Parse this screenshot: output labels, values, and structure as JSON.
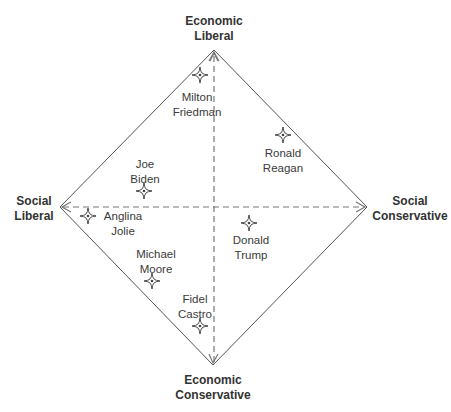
{
  "diagram": {
    "type": "political-compass-diamond",
    "axes": {
      "top": {
        "line1": "Economic",
        "line2": "Liberal"
      },
      "bottom": {
        "line1": "Economic",
        "line2": "Conservative"
      },
      "left": {
        "line1": "Social",
        "line2": "Liberal"
      },
      "right": {
        "line1": "Social",
        "line2": "Conservative"
      }
    },
    "colors": {
      "line": "#555555",
      "dashed_axis": "#777777",
      "marker": "#444444",
      "text": "#333333"
    },
    "people": [
      {
        "line1": "Milton",
        "line2": "Friedman",
        "marker_x": 200,
        "marker_y": 75
      },
      {
        "line1": "Ronald",
        "line2": "Reagan",
        "marker_x": 283,
        "marker_y": 135
      },
      {
        "line1": "Joe",
        "line2": "Biden",
        "marker_x": 144,
        "marker_y": 191
      },
      {
        "line1": "Anglina",
        "line2": "Jolie",
        "marker_x": 88,
        "marker_y": 216
      },
      {
        "line1": "Donald",
        "line2": "Trump",
        "marker_x": 249,
        "marker_y": 223
      },
      {
        "line1": "Michael",
        "line2": "Moore",
        "marker_x": 152,
        "marker_y": 281
      },
      {
        "line1": "Fidel",
        "line2": "Castro",
        "marker_x": 200,
        "marker_y": 326
      }
    ]
  }
}
